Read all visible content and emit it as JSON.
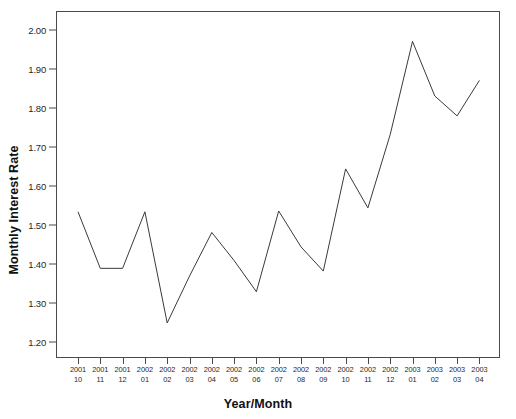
{
  "figure": {
    "name": "monthly-interest-rate-line-chart",
    "background_color": "#ffffff",
    "frame_color": "#4a4a4a",
    "line_color": "#3a3a3a",
    "top_cutoff_text": ""
  },
  "chart_data": {
    "type": "line",
    "title": "",
    "xlabel": "Year/Month",
    "ylabel": "Monthly Interest Rate",
    "grid": false,
    "legend": false,
    "legend_position": "none",
    "ylim": [
      1.16,
      2.05
    ],
    "yticks": [
      1.2,
      1.3,
      1.4,
      1.5,
      1.6,
      1.7,
      1.8,
      1.9,
      2.0
    ],
    "ytick_labels": [
      "1.20",
      "1.30",
      "1.40",
      "1.50",
      "1.60",
      "1.70",
      "1.80",
      "1.90",
      "2.00"
    ],
    "categories": [
      "2001 10",
      "2001 11",
      "2001 12",
      "2002 01",
      "2002 02",
      "2002 03",
      "2002 04",
      "2002 05",
      "2002 06",
      "2002 07",
      "2002 08",
      "2002 09",
      "2002 10",
      "2002 11",
      "2002 12",
      "2003 01",
      "2003 02",
      "2003 03",
      "2003 04"
    ],
    "xtick_labels": [
      {
        "year": "2001",
        "month": "10"
      },
      {
        "year": "2001",
        "month": "11"
      },
      {
        "year": "2001",
        "month": "12"
      },
      {
        "year": "2002",
        "month": "01"
      },
      {
        "year": "2002",
        "month": "02"
      },
      {
        "year": "2002",
        "month": "03"
      },
      {
        "year": "2002",
        "month": "04"
      },
      {
        "year": "2002",
        "month": "05"
      },
      {
        "year": "2002",
        "month": "06"
      },
      {
        "year": "2002",
        "month": "07"
      },
      {
        "year": "2002",
        "month": "08"
      },
      {
        "year": "2002",
        "month": "09"
      },
      {
        "year": "2002",
        "month": "10"
      },
      {
        "year": "2002",
        "month": "11"
      },
      {
        "year": "2002",
        "month": "12"
      },
      {
        "year": "2003",
        "month": "01"
      },
      {
        "year": "2003",
        "month": "02"
      },
      {
        "year": "2003",
        "month": "03"
      },
      {
        "year": "2003",
        "month": "04"
      }
    ],
    "series": [
      {
        "name": "Monthly Interest Rate",
        "values": [
          1.535,
          1.39,
          1.39,
          1.535,
          1.25,
          1.37,
          1.482,
          1.41,
          1.33,
          1.537,
          1.445,
          1.383,
          1.645,
          1.545,
          1.733,
          1.972,
          1.832,
          1.781,
          1.872
        ]
      }
    ],
    "values": [
      1.535,
      1.39,
      1.39,
      1.535,
      1.25,
      1.37,
      1.482,
      1.41,
      1.33,
      1.537,
      1.445,
      1.383,
      1.645,
      1.545,
      1.733,
      1.972,
      1.832,
      1.781,
      1.872
    ]
  }
}
